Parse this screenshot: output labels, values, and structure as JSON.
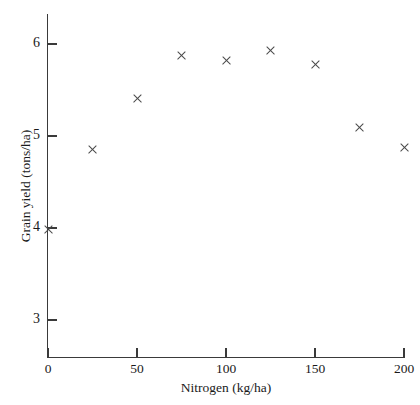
{
  "chart_data": {
    "type": "scatter",
    "title": "",
    "xlabel": "Nitrogen (kg/ha)",
    "ylabel": "Grain yield (tons/ha)",
    "xlim": [
      0,
      200
    ],
    "ylim": [
      2.75,
      6.35
    ],
    "xticks": [
      0,
      50,
      100,
      150,
      200
    ],
    "xtick_labels": [
      "0",
      "50",
      "100",
      "150",
      "200"
    ],
    "yticks": [
      3,
      4,
      5,
      6
    ],
    "ytick_labels": [
      "3",
      "4",
      "5",
      "6"
    ],
    "grid": false,
    "legend": null,
    "marker": "x",
    "marker_color": "#4a4a4a",
    "x": [
      0,
      25,
      50,
      75,
      100,
      125,
      150,
      175,
      200
    ],
    "y": [
      3.98,
      4.85,
      5.41,
      5.87,
      5.82,
      5.93,
      5.78,
      5.09,
      4.87
    ],
    "points": [
      {
        "x": 0,
        "y": 3.98
      },
      {
        "x": 25,
        "y": 4.85
      },
      {
        "x": 50,
        "y": 5.41
      },
      {
        "x": 75,
        "y": 5.87
      },
      {
        "x": 100,
        "y": 5.82
      },
      {
        "x": 125,
        "y": 5.93
      },
      {
        "x": 150,
        "y": 5.78
      },
      {
        "x": 175,
        "y": 5.09
      },
      {
        "x": 200,
        "y": 4.87
      }
    ]
  },
  "axes": {
    "x_axis_name": "nitrogen-axis",
    "y_axis_name": "grain-yield-axis"
  }
}
